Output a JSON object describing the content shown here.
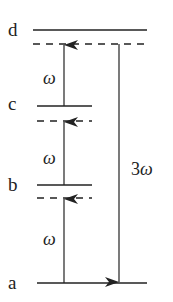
{
  "levels": {
    "d": {
      "label": "d"
    },
    "c": {
      "label": "c"
    },
    "b": {
      "label": "b"
    },
    "a": {
      "label": "a"
    }
  },
  "transitions": {
    "up1": {
      "label": "ω"
    },
    "up2": {
      "label": "ω"
    },
    "up3": {
      "label": "ω"
    },
    "down": {
      "label": "3ω"
    }
  },
  "colors": {
    "line": "#222222",
    "background": "#ffffff"
  }
}
